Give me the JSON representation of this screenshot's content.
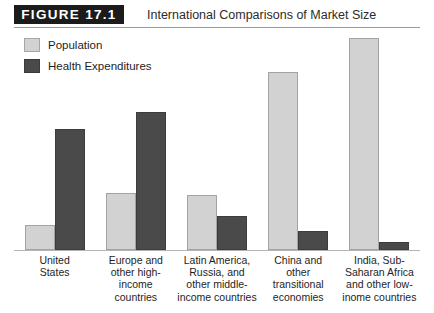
{
  "figure": {
    "badge": "FIGURE 17.1",
    "title": "International Comparisons of Market Size"
  },
  "legend": [
    {
      "label": "Population",
      "color": "#d2d2d2",
      "key": "population"
    },
    {
      "label": "Health Expenditures",
      "color": "#4a4a4a",
      "key": "health_expenditures"
    }
  ],
  "chart_data": {
    "type": "bar",
    "title": "International Comparisons of Market Size",
    "xlabel": "",
    "ylabel": "",
    "ylim": [
      0,
      100
    ],
    "grid": false,
    "legend_position": "top-left",
    "axis_tick_labels": [],
    "categories": [
      "United States",
      "Europe and other high-income countries",
      "Latin America, Russia, and other middle-income countries",
      "China and other transitional economies",
      "India, Sub-Saharan Africa and other low-inome countries"
    ],
    "category_lines": [
      [
        "United",
        "States"
      ],
      [
        "Europe and",
        "other high-",
        "income",
        "countries"
      ],
      [
        "Latin America,",
        "Russia, and",
        "other middle-",
        "income countries"
      ],
      [
        "China and",
        "other",
        "transitional",
        "economies"
      ],
      [
        "India, Sub-",
        "Saharan Africa",
        "and other low-",
        "inome countries"
      ]
    ],
    "series": [
      {
        "name": "Population",
        "color": "#d2d2d2",
        "values": [
          12,
          27,
          26,
          84,
          100
        ]
      },
      {
        "name": "Health Expenditures",
        "color": "#4a4a4a",
        "values": [
          57,
          65,
          16,
          9,
          4
        ]
      }
    ]
  }
}
